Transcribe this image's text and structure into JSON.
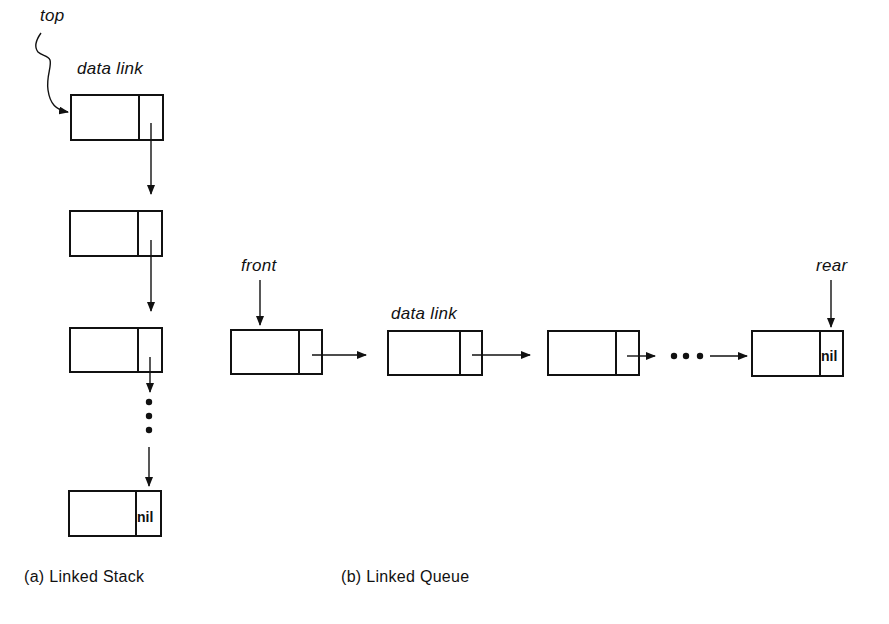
{
  "diagram": {
    "type": "linked-data-structures",
    "stack": {
      "pointer_label": "top",
      "field_labels": "data link",
      "node_count_shown": 4,
      "ellipsis": "⋮",
      "terminal_value": "nil",
      "caption": "(a)  Linked  Stack"
    },
    "queue": {
      "front_label": "front",
      "rear_label": "rear",
      "field_labels": "data link",
      "node_count_shown": 4,
      "ellipsis": "• • •",
      "terminal_value": "nil",
      "caption": "(b)  Linked  Queue"
    }
  }
}
